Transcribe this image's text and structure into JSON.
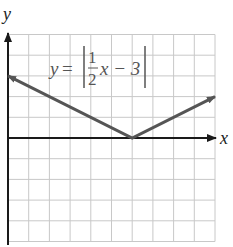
{
  "chart_data": {
    "type": "line",
    "title": "",
    "equation": {
      "lhs": "y",
      "equals": "=",
      "numerator": "1",
      "denominator": "2",
      "rest": "x − 3"
    },
    "xlabel": "x",
    "ylabel": "y",
    "grid": true,
    "xlim": [
      0,
      10
    ],
    "ylim": [
      -5,
      5
    ],
    "grid_step": 1,
    "series": [
      {
        "name": "y = |(1/2)x − 3|",
        "x": [
          0,
          6,
          10
        ],
        "y": [
          3,
          0,
          2
        ],
        "arrows": "both",
        "color": "#555555"
      }
    ],
    "vertex": {
      "x": 6,
      "y": 0
    }
  },
  "colors": {
    "grid": "#c8c8c8",
    "axis": "#1a1a1a",
    "curve": "#555555"
  }
}
